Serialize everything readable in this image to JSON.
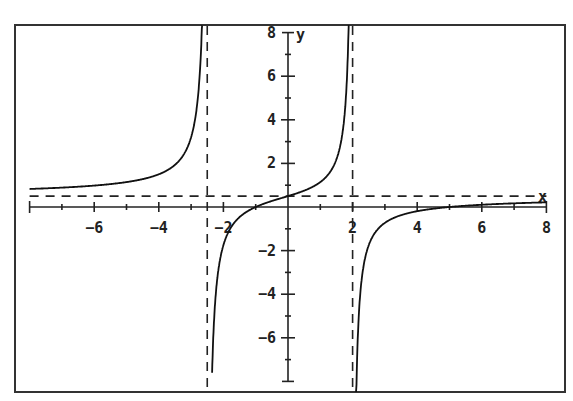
{
  "chart_data": {
    "type": "line",
    "title": "",
    "xlabel": "x",
    "ylabel": "y",
    "xlim": [
      -8,
      8
    ],
    "ylim": [
      -8,
      8
    ],
    "grid": false,
    "x_ticks": [
      -6,
      -4,
      -2,
      2,
      4,
      6,
      8
    ],
    "x_tick_labels": [
      "-6",
      "-4",
      "-2",
      "2",
      "4",
      "6",
      "8"
    ],
    "y_ticks": [
      8,
      6,
      4,
      2,
      -2,
      -4,
      -6
    ],
    "y_tick_labels": [
      "8",
      "6",
      "4",
      "2",
      "-2",
      "-4",
      "-6"
    ],
    "function": "y = 0.5(x+1)(x-5)/((x+2.5)(x-2))",
    "asymptotes": {
      "vertical": [
        -2.5,
        2
      ],
      "horizontal": [
        0.5
      ]
    },
    "series": [
      {
        "name": "left branch",
        "x": [
          -8,
          -7,
          -6,
          -5,
          -4,
          -3.5,
          -3,
          -2.8,
          -2.65
        ],
        "y": [
          0.83,
          0.89,
          0.99,
          1.16,
          1.48,
          1.88,
          3.1,
          4.95,
          8.6
        ]
      },
      {
        "name": "middle branch",
        "x": [
          -2.35,
          -2.2,
          -2,
          -1.5,
          -1,
          -0.5,
          0,
          0.5,
          1,
          1.5,
          1.8,
          1.9
        ],
        "y": [
          -7.9,
          -4.3,
          -2.33,
          -0.81,
          0,
          0.36,
          0.5,
          0.73,
          1.14,
          2.17,
          4.14,
          8.4
        ],
        "intercepts": {
          "x": -1,
          "y": 0.5
        }
      },
      {
        "name": "right branch",
        "x": [
          2.08,
          2.2,
          2.5,
          3,
          4,
          5,
          5.5,
          6,
          7,
          8
        ],
        "y": [
          -8.1,
          -3.4,
          -1.43,
          -0.58,
          -0.12,
          0,
          0.03,
          0.07,
          0.14,
          0.21
        ]
      }
    ]
  },
  "axis": {
    "x_label": "x",
    "y_label": "y"
  }
}
